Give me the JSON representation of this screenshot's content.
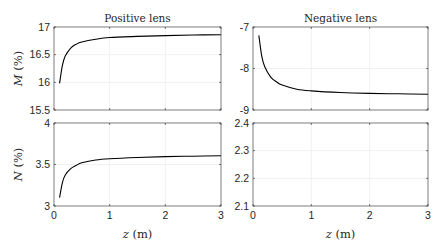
{
  "figure": {
    "top_cutoff_text": "···",
    "xlabel": "z (m)",
    "panels": [
      {
        "id": "tl",
        "title": "Positive lens",
        "ylabel": "M (%)"
      },
      {
        "id": "tr",
        "title": "Negative lens",
        "ylabel": ""
      },
      {
        "id": "bl",
        "title": "",
        "ylabel": "N (%)"
      },
      {
        "id": "br",
        "title": "",
        "ylabel": ""
      }
    ]
  },
  "chart_data": [
    {
      "type": "line",
      "title": "Positive lens",
      "xlabel": "",
      "ylabel": "M (%)",
      "xlim": [
        0,
        3
      ],
      "ylim": [
        15.5,
        17
      ],
      "xticks": [
        0,
        1,
        2,
        3
      ],
      "yticks": [
        15.5,
        16,
        16.5,
        17
      ],
      "ytick_labels": [
        "15.5",
        "16",
        "16.5",
        "17"
      ],
      "grid": true,
      "series": [
        {
          "name": "M",
          "color": "#000000",
          "x": [
            0.1,
            0.15,
            0.2,
            0.3,
            0.4,
            0.5,
            0.75,
            1.0,
            1.5,
            2.0,
            2.5,
            3.0
          ],
          "y": [
            15.98,
            16.3,
            16.47,
            16.62,
            16.69,
            16.73,
            16.78,
            16.81,
            16.83,
            16.845,
            16.855,
            16.86
          ]
        }
      ]
    },
    {
      "type": "line",
      "title": "Negative lens",
      "xlabel": "",
      "ylabel": "",
      "xlim": [
        0,
        3
      ],
      "ylim": [
        -9,
        -7
      ],
      "xticks": [
        0,
        1,
        2,
        3
      ],
      "yticks": [
        -9,
        -8,
        -7
      ],
      "ytick_labels": [
        "-9",
        "-8",
        "-7"
      ],
      "grid": true,
      "series": [
        {
          "name": "M",
          "color": "#000000",
          "x": [
            0.1,
            0.15,
            0.2,
            0.3,
            0.4,
            0.5,
            0.75,
            1.0,
            1.5,
            2.0,
            2.5,
            3.0
          ],
          "y": [
            -7.2,
            -7.7,
            -7.95,
            -8.2,
            -8.32,
            -8.4,
            -8.5,
            -8.54,
            -8.58,
            -8.6,
            -8.61,
            -8.62
          ]
        }
      ]
    },
    {
      "type": "line",
      "title": "",
      "xlabel": "z (m)",
      "ylabel": "N (%)",
      "xlim": [
        0,
        3
      ],
      "ylim": [
        3,
        4
      ],
      "xticks": [
        0,
        1,
        2,
        3
      ],
      "yticks": [
        3,
        3.5,
        4
      ],
      "ytick_labels": [
        "3",
        "3.5",
        "4"
      ],
      "grid": true,
      "series": [
        {
          "name": "N",
          "color": "#000000",
          "x": [
            0.1,
            0.15,
            0.2,
            0.3,
            0.4,
            0.5,
            0.75,
            1.0,
            1.5,
            2.0,
            2.5,
            3.0
          ],
          "y": [
            3.1,
            3.28,
            3.37,
            3.45,
            3.49,
            3.52,
            3.555,
            3.57,
            3.585,
            3.595,
            3.6,
            3.605
          ]
        }
      ]
    },
    {
      "type": "line",
      "title": "",
      "xlabel": "z (m)",
      "ylabel": "",
      "xlim": [
        0,
        3
      ],
      "ylim": [
        2.1,
        2.4
      ],
      "xticks": [
        0,
        1,
        2,
        3
      ],
      "yticks": [
        2.1,
        2.2,
        2.3,
        2.4
      ],
      "ytick_labels": [
        "2.1",
        "2.2",
        "2.3",
        "2.4"
      ],
      "grid": true,
      "series": []
    }
  ]
}
